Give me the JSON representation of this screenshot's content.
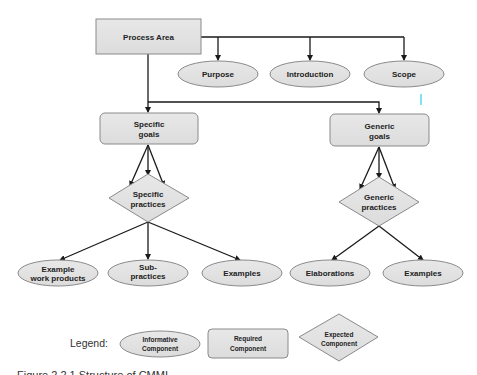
{
  "diagram": {
    "nodes": {
      "process_area": {
        "label": "Process Area",
        "type": "required"
      },
      "purpose": {
        "label": "Purpose",
        "type": "informative"
      },
      "introduction": {
        "label": "Introduction",
        "type": "informative"
      },
      "scope": {
        "label": "Scope",
        "type": "informative"
      },
      "specific_goals": {
        "line1": "Specific",
        "line2": "goals",
        "type": "required"
      },
      "generic_goals": {
        "line1": "Generic",
        "line2": "goals",
        "type": "required"
      },
      "specific_practices": {
        "line1": "Specific",
        "line2": "practices",
        "type": "expected"
      },
      "generic_practices": {
        "line1": "Generic",
        "line2": "practices",
        "type": "expected"
      },
      "example_work_products": {
        "line1": "Example",
        "line2": "work products",
        "type": "informative"
      },
      "subpractices": {
        "line1": "Sub-",
        "line2": "practices",
        "type": "informative"
      },
      "examples_specific": {
        "label": "Examples",
        "type": "informative"
      },
      "elaborations": {
        "label": "Elaborations",
        "type": "informative"
      },
      "examples_generic": {
        "label": "Examples",
        "type": "informative"
      }
    },
    "edges": [
      [
        "process_area",
        "purpose"
      ],
      [
        "process_area",
        "introduction"
      ],
      [
        "process_area",
        "scope"
      ],
      [
        "process_area",
        "specific_goals"
      ],
      [
        "process_area",
        "generic_goals"
      ],
      [
        "specific_goals",
        "specific_practices"
      ],
      [
        "generic_goals",
        "generic_practices"
      ],
      [
        "specific_practices",
        "example_work_products"
      ],
      [
        "specific_practices",
        "subpractices"
      ],
      [
        "specific_practices",
        "examples_specific"
      ],
      [
        "generic_practices",
        "elaborations"
      ],
      [
        "generic_practices",
        "examples_generic"
      ]
    ]
  },
  "legend": {
    "title": "Legend:",
    "informative": {
      "line1": "Informative",
      "line2": "Component"
    },
    "required": {
      "line1": "Required",
      "line2": "Component"
    },
    "expected": {
      "line1": "Expected",
      "line2": "Component"
    }
  },
  "caption": "Figure 2.2.1   Structure of CMMI",
  "colors": {
    "fill": "#e2e2e2",
    "stroke": "#8a8a8a",
    "line": "#1a1a1a",
    "text": "#222222"
  }
}
